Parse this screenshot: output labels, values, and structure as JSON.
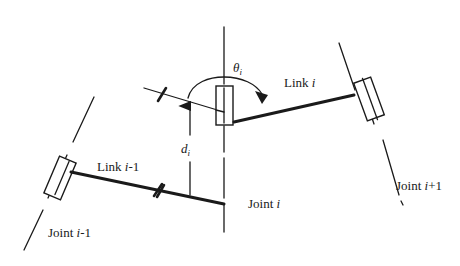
{
  "diagram": {
    "type": "Denavit-Hartenberg link/joint parameters",
    "labels": {
      "joint_prev": {
        "name": "Joint ",
        "index": "i",
        "suffix": "-1"
      },
      "joint_cur": {
        "name": "Joint ",
        "index": "i",
        "suffix": ""
      },
      "joint_next": {
        "name": "Joint ",
        "index": "i",
        "suffix": "+1"
      },
      "link_prev": {
        "name": "Link ",
        "index": "i",
        "suffix": "-1"
      },
      "link_cur": {
        "name": "Link ",
        "index": "i",
        "suffix": ""
      },
      "theta": {
        "symbol": "θ",
        "sub": "i"
      },
      "offset": {
        "symbol": "d",
        "sub": "i"
      }
    },
    "colors": {
      "ink": "#1a1a1a",
      "background": "#ffffff"
    }
  }
}
